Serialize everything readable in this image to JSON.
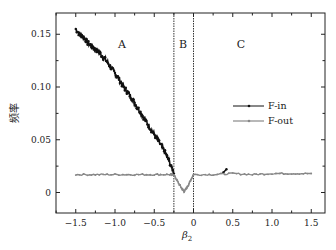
{
  "chart_data": {
    "type": "line",
    "title": "",
    "xlabel": "β2",
    "ylabel": "频率",
    "xlim": [
      -1.75,
      1.75
    ],
    "ylim": [
      -0.02,
      0.165
    ],
    "xticks": [
      -1.5,
      -1.0,
      -0.5,
      0,
      0.5,
      1.0,
      1.5
    ],
    "xtick_labels": [
      "−1.5",
      "−1.0",
      "−0.5",
      "0",
      "0.5",
      "1.0",
      "1.5"
    ],
    "yticks": [
      0,
      0.05,
      0.1,
      0.15
    ],
    "ytick_labels": [
      "0",
      "0.05",
      "0.10",
      "0.15"
    ],
    "grid": false,
    "legend_position": "right-middle",
    "region_boundaries": [
      -0.25,
      0
    ],
    "region_labels": [
      {
        "text": "A",
        "x": -0.95,
        "y": 0.135
      },
      {
        "text": "B",
        "x": -0.12,
        "y": 0.135
      },
      {
        "text": "C",
        "x": 0.6,
        "y": 0.135
      }
    ],
    "series": [
      {
        "name": "F-in",
        "color": "#111111",
        "marker": "dot",
        "x": [
          -1.5,
          -1.45,
          -1.4,
          -1.35,
          -1.3,
          -1.25,
          -1.2,
          -1.15,
          -1.1,
          -1.05,
          -1.0,
          -0.95,
          -0.9,
          -0.85,
          -0.8,
          -0.75,
          -0.7,
          -0.65,
          -0.6,
          -0.55,
          -0.5,
          -0.45,
          -0.4,
          -0.35,
          -0.3,
          -0.25,
          0.38,
          0.42
        ],
        "values": [
          0.155,
          0.15,
          0.147,
          0.142,
          0.139,
          0.136,
          0.133,
          0.128,
          0.124,
          0.118,
          0.113,
          0.108,
          0.101,
          0.096,
          0.091,
          0.085,
          0.079,
          0.073,
          0.067,
          0.061,
          0.055,
          0.049,
          0.043,
          0.036,
          0.028,
          0.018,
          0.019,
          0.022
        ]
      },
      {
        "name": "F-out",
        "color": "#888888",
        "marker": "dot",
        "x": [
          -1.5,
          -1.25,
          -1.0,
          -0.75,
          -0.5,
          -0.3,
          -0.25,
          -0.2,
          -0.15,
          -0.12,
          -0.08,
          -0.04,
          0,
          0.25,
          0.5,
          0.75,
          1.0,
          1.25,
          1.5
        ],
        "values": [
          0.017,
          0.017,
          0.017,
          0.017,
          0.017,
          0.017,
          0.017,
          0.01,
          0.004,
          0.001,
          0.005,
          0.011,
          0.017,
          0.017,
          0.018,
          0.017,
          0.018,
          0.018,
          0.018
        ]
      }
    ]
  },
  "axes": {
    "xlabel_main": "β",
    "xlabel_sub": "2",
    "ylabel": "频率"
  },
  "legend": {
    "items": [
      {
        "label": "F-in",
        "color": "#111111"
      },
      {
        "label": "F-out",
        "color": "#888888"
      }
    ]
  },
  "regions": {
    "a": "A",
    "b": "B",
    "c": "C"
  }
}
